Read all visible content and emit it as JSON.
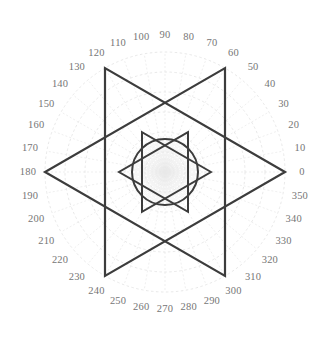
{
  "chart_data": {
    "type": "line",
    "title": "",
    "subtitle": "",
    "xlabel": "",
    "ylabel": "",
    "coordinate_system": "polar",
    "angle_unit": "degrees",
    "angle_direction": "counterclockwise",
    "zero_angle_position": "east",
    "grid": true,
    "grid_style": "dashed",
    "grid_color": "#e2e2e2",
    "legend": "none",
    "rlim": [
      0,
      120
    ],
    "r_gridlines": [
      20,
      40,
      60,
      80,
      100,
      120
    ],
    "theta_tick_step": 10,
    "theta_tick_labels": [
      "0",
      "10",
      "20",
      "30",
      "40",
      "50",
      "60",
      "70",
      "80",
      "90",
      "100",
      "110",
      "120",
      "130",
      "140",
      "150",
      "160",
      "170",
      "180",
      "190",
      "200",
      "210",
      "220",
      "230",
      "240",
      "250",
      "260",
      "270",
      "280",
      "290",
      "300",
      "310",
      "320",
      "330",
      "340",
      "350"
    ],
    "theta_tick_values": [
      0,
      10,
      20,
      30,
      40,
      50,
      60,
      70,
      80,
      90,
      100,
      110,
      120,
      130,
      140,
      150,
      160,
      170,
      180,
      190,
      200,
      210,
      220,
      230,
      240,
      250,
      260,
      270,
      280,
      290,
      300,
      310,
      320,
      330,
      340,
      350
    ],
    "series": [
      {
        "name": "outer-triangle-up",
        "shape": "triangle",
        "color": "#3c3c3c",
        "line_width": 2.2,
        "closed": true,
        "points": [
          {
            "theta": 0,
            "r": 120
          },
          {
            "theta": 120,
            "r": 120
          },
          {
            "theta": 240,
            "r": 120
          }
        ]
      },
      {
        "name": "outer-triangle-down",
        "shape": "triangle",
        "color": "#3c3c3c",
        "line_width": 2.2,
        "closed": true,
        "points": [
          {
            "theta": 60,
            "r": 120
          },
          {
            "theta": 180,
            "r": 120
          },
          {
            "theta": 300,
            "r": 120
          }
        ]
      },
      {
        "name": "inner-triangle-up",
        "shape": "triangle",
        "color": "#3c3c3c",
        "line_width": 2.0,
        "closed": true,
        "points": [
          {
            "theta": 0,
            "r": 46
          },
          {
            "theta": 120,
            "r": 46
          },
          {
            "theta": 240,
            "r": 46
          }
        ]
      },
      {
        "name": "inner-triangle-down",
        "shape": "triangle",
        "color": "#3c3c3c",
        "line_width": 2.0,
        "closed": true,
        "points": [
          {
            "theta": 60,
            "r": 46
          },
          {
            "theta": 180,
            "r": 46
          },
          {
            "theta": 300,
            "r": 46
          }
        ]
      },
      {
        "name": "inner-circle",
        "shape": "circle",
        "color": "#3c3c3c",
        "line_width": 2.0,
        "closed": true,
        "constant_r": 33
      }
    ]
  },
  "geometry": {
    "center_x": 165,
    "center_y": 172,
    "outer_radius_px": 120,
    "inner_radius_px": 46,
    "circle_radius_px": 33,
    "label_radius_px": 137
  },
  "colors": {
    "background": "#ffffff",
    "plot_line": "#3c3c3c",
    "grid": "#e2e2e2",
    "spoke": "#e8e8e8",
    "label_text": "#767676"
  }
}
